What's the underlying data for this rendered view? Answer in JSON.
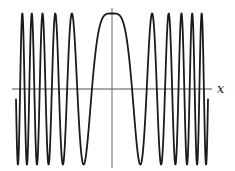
{
  "chart_data": {
    "type": "line",
    "title": "",
    "function": "cos(x^2)",
    "xlabel": "x",
    "ylabel": "",
    "xlim": [
      -6.0,
      6.0
    ],
    "ylim": [
      -1,
      1
    ],
    "grid": false,
    "legend": null,
    "axes": {
      "x_axis_at_y": 0,
      "y_axis_at_x": 0,
      "ticks": false
    },
    "series": [
      {
        "name": "cos(x^2)",
        "color": "#1a1a1a",
        "x": [
          -6.0,
          -5.5,
          -5.0,
          -4.5,
          -4.0,
          -3.5,
          -3.0,
          -2.5,
          -2.0,
          -1.5,
          -1.0,
          -0.5,
          0.0,
          0.5,
          1.0,
          1.5,
          2.0,
          2.5,
          3.0,
          3.5,
          4.0,
          4.5,
          5.0,
          5.5,
          6.0
        ],
        "values": [
          -0.128,
          0.832,
          0.991,
          0.963,
          -0.958,
          0.987,
          -0.911,
          0.999,
          -0.654,
          -0.628,
          0.54,
          0.969,
          1.0,
          0.969,
          0.54,
          -0.628,
          -0.654,
          0.999,
          -0.911,
          0.987,
          -0.958,
          0.963,
          0.991,
          0.832,
          -0.128
        ]
      }
    ],
    "extrema": {
      "peaks_x": [
        -5.6,
        -5.01,
        -4.34,
        -3.54,
        -2.51,
        0,
        2.51,
        3.54,
        4.34,
        5.01,
        5.6
      ],
      "troughs_x": [
        -5.88,
        -5.31,
        -4.68,
        -3.96,
        -3.07,
        -1.77,
        1.77,
        3.07,
        3.96,
        4.68,
        5.31,
        5.88
      ]
    }
  },
  "labels": {
    "x_axis": "x"
  },
  "style": {
    "line_color": "#1a1a1a",
    "axis_color": "#555555"
  }
}
